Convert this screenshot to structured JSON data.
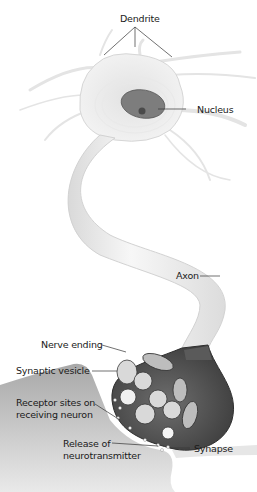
{
  "diagram": {
    "type": "anatomical-illustration",
    "subject": "neuron",
    "labels": {
      "dendrite": "Dendrite",
      "nucleus": "Nucleus",
      "axon": "Axon",
      "nerve_ending": "Nerve ending",
      "synaptic_vesicle": "Synaptic vesicle",
      "receptor_sites_line1": "Receptor sites on",
      "receptor_sites_line2": "receiving neuron",
      "release_line1": "Release of",
      "release_line2": "neurotransmitter",
      "synapse": "Synapse"
    },
    "colors": {
      "cell_body": "#ececec",
      "nucleus": "#7d7d7d",
      "nucleolus": "#4a4a4a",
      "axon": "#ededed",
      "nerve_ending_dark": "#555555",
      "receiving_neuron": "#9a9a9a",
      "leader_line": "#333333"
    }
  }
}
